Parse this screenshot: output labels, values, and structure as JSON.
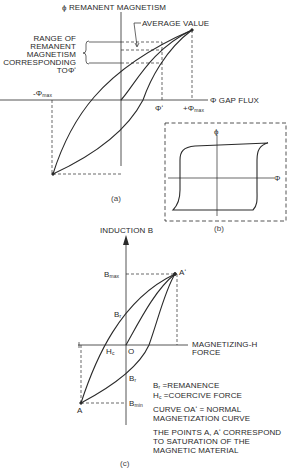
{
  "figure_a": {
    "y_axis_label": "ϕ REMANENT MAGNETISM",
    "x_axis_label": "Φ GAP FLUX",
    "average_value_label": "AVERAGE VALUE",
    "range_label_lines": [
      "RANGE OF",
      "REMANENT",
      "MAGNETISM",
      "CORRESPONDING",
      "TOΦʹ"
    ],
    "neg_phi_max": "-Φ",
    "neg_phi_max_sub": "max",
    "phi_prime": "Φʹ",
    "pos_phi_max": "+Φ",
    "pos_phi_max_sub": "max",
    "caption": "(a)"
  },
  "figure_b": {
    "y_axis_label": "ϕ",
    "x_axis_label": "Φ",
    "caption": "(b)"
  },
  "figure_c": {
    "y_axis_label": "INDUCTION B",
    "x_axis_label_lines": [
      "MAGNETIZING-H",
      "FORCE"
    ],
    "b_max": "B",
    "b_max_sub": "max",
    "b_min": "B",
    "b_min_sub": "min",
    "br_upper": "B",
    "br_upper_sub": "r",
    "br_lower": "B",
    "br_lower_sub": "r",
    "hc": "H",
    "hc_sub": "c",
    "origin": "O",
    "point_a": "A",
    "point_a_prime": "Aʹ",
    "legend": [
      {
        "sym": "B",
        "sub": "r",
        "text": " =REMANENCE"
      },
      {
        "sym": "H",
        "sub": "c",
        "text": " =COERCIVE FORCE"
      }
    ],
    "curve_note_lines": [
      "CURVE OAʹ = NORMAL",
      "MAGNETIZATION CURVE"
    ],
    "saturation_note_lines": [
      "THE POINTS A, Aʹ CORRESPOND",
      "TO SATURATION OF THE",
      "MAGNETIC MATERIAL"
    ],
    "caption": "(c)"
  },
  "colors": {
    "line": "#2a2a2a",
    "background": "#ffffff"
  }
}
